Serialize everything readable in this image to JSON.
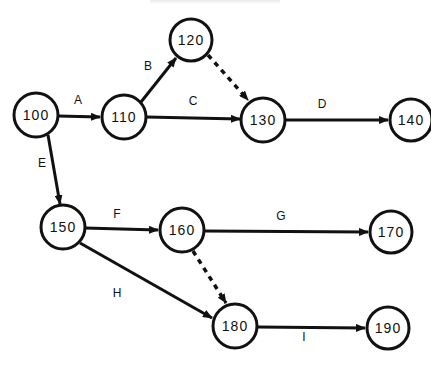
{
  "diagram": {
    "type": "activity-on-arrow network",
    "caption_cut_off": true,
    "nodes": [
      {
        "id": "100",
        "label": "100",
        "x": 36,
        "y": 115
      },
      {
        "id": "110",
        "label": "110",
        "x": 124,
        "y": 117
      },
      {
        "id": "120",
        "label": "120",
        "x": 191,
        "y": 40
      },
      {
        "id": "130",
        "label": "130",
        "x": 263,
        "y": 120
      },
      {
        "id": "140",
        "label": "140",
        "x": 411,
        "y": 120
      },
      {
        "id": "150",
        "label": "150",
        "x": 63,
        "y": 227
      },
      {
        "id": "160",
        "label": "160",
        "x": 182,
        "y": 230
      },
      {
        "id": "170",
        "label": "170",
        "x": 391,
        "y": 232
      },
      {
        "id": "180",
        "label": "180",
        "x": 235,
        "y": 326
      },
      {
        "id": "190",
        "label": "190",
        "x": 388,
        "y": 328
      }
    ],
    "edges": [
      {
        "from": "100",
        "to": "110",
        "label": "A",
        "style": "solid"
      },
      {
        "from": "110",
        "to": "120",
        "label": "B",
        "style": "solid"
      },
      {
        "from": "110",
        "to": "130",
        "label": "C",
        "style": "solid"
      },
      {
        "from": "120",
        "to": "130",
        "label": "",
        "style": "dashed"
      },
      {
        "from": "130",
        "to": "140",
        "label": "D",
        "style": "solid"
      },
      {
        "from": "100",
        "to": "150",
        "label": "E",
        "style": "solid"
      },
      {
        "from": "150",
        "to": "160",
        "label": "F",
        "style": "solid"
      },
      {
        "from": "160",
        "to": "170",
        "label": "G",
        "style": "solid"
      },
      {
        "from": "150",
        "to": "180",
        "label": "H",
        "style": "solid"
      },
      {
        "from": "160",
        "to": "180",
        "label": "",
        "style": "dashed"
      },
      {
        "from": "180",
        "to": "190",
        "label": "I",
        "style": "solid"
      }
    ]
  },
  "labels": {
    "n100": "100",
    "n110": "110",
    "n120": "120",
    "n130": "130",
    "n140": "140",
    "n150": "150",
    "n160": "160",
    "n170": "170",
    "n180": "180",
    "n190": "190",
    "A": "A",
    "B": "B",
    "C": "C",
    "D": "D",
    "E": "E",
    "F": "F",
    "G": "G",
    "H": "H",
    "I": "I"
  },
  "colors": {
    "line": "#111111",
    "background": "#ffffff"
  }
}
